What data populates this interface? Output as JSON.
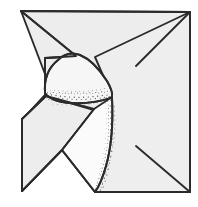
{
  "figure": {
    "title": "Origami paper fold diagram",
    "canvas": {
      "width": 198,
      "height": 207
    },
    "colors": {
      "background": "#ffffff",
      "paper_fill": "#ededed",
      "paper_fill_light": "#f4f4f4",
      "paper_fill_lighter": "#fafafa",
      "ink": "#2b2b2b",
      "stipple": "#3a3a3a"
    },
    "line_weight": 1.9,
    "shapes": {
      "base_sheet": "21,11 190,12 190,192 95,192 62,150 22,191 22,120 45,95 45,58 62,57",
      "right_sheet": "95,57 190,12 190,192 95,192 112,120",
      "top_left_flap": "21,11 75,57 62,57 45,58 45,72",
      "lower_left_flap": "22,120 45,95 93,110 62,150 22,191",
      "curved_flap": "58,60 66,52 80,53 95,62 108,80 112,96 100,99 70,100 50,99 44,92 46,78",
      "inner_flap": "93,108 112,96 108,150 95,192 62,150",
      "crease_top_right": "136,66 190,12",
      "crease_bottom_right": "136,146 190,192",
      "stipple_band_upper": "44,92 52,98 75,101 100,99 110,94 108,99 86,107 58,106 46,99",
      "stipple_band_right": "112,96 118,120 112,160 97,192 93,186 105,155 108,120 106,100"
    },
    "stipple_dot_count": 340,
    "crease_lines": [
      {
        "name": "upper-right-crease",
        "from": [
          136,
          66
        ],
        "to": [
          190,
          12
        ]
      },
      {
        "name": "lower-right-crease",
        "from": [
          136,
          146
        ],
        "to": [
          190,
          192
        ]
      }
    ]
  }
}
